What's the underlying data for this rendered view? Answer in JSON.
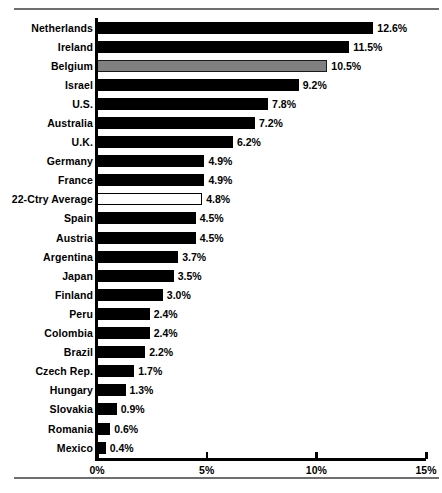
{
  "chart_data": {
    "type": "bar",
    "orientation": "horizontal",
    "title": "",
    "xlabel": "",
    "ylabel": "",
    "xlim": [
      0,
      15
    ],
    "xtick_labels": [
      "0%",
      "5%",
      "10%",
      "15%"
    ],
    "xticks": [
      0,
      5,
      10,
      15
    ],
    "grid": false,
    "legend": null,
    "value_suffix": "%",
    "colors": {
      "bar": "#000000",
      "highlight": "#808080",
      "hollow_fill": "#ffffff",
      "outline": "#000000",
      "rule": "#6e6e6e"
    },
    "categories": [
      "Netherlands",
      "Ireland",
      "Belgium",
      "Israel",
      "U.S.",
      "Australia",
      "U.K.",
      "Germany",
      "France",
      "22-Ctry Average",
      "Spain",
      "Austria",
      "Argentina",
      "Japan",
      "Finland",
      "Peru",
      "Colombia",
      "Brazil",
      "Czech Rep.",
      "Hungary",
      "Slovakia",
      "Romania",
      "Mexico"
    ],
    "values": [
      12.6,
      11.5,
      10.5,
      9.2,
      7.8,
      7.2,
      6.2,
      4.9,
      4.9,
      4.8,
      4.5,
      4.5,
      3.7,
      3.5,
      3.0,
      2.4,
      2.4,
      2.2,
      1.7,
      1.3,
      0.9,
      0.6,
      0.4
    ],
    "value_labels": [
      "12.6%",
      "11.5%",
      "10.5%",
      "9.2%",
      "7.8%",
      "7.2%",
      "6.2%",
      "4.9%",
      "4.9%",
      "4.8%",
      "4.5%",
      "4.5%",
      "3.7%",
      "3.5%",
      "3.0%",
      "2.4%",
      "2.4%",
      "2.2%",
      "1.7%",
      "1.3%",
      "0.9%",
      "0.6%",
      "0.4%"
    ],
    "bar_styles": [
      "solid",
      "solid",
      "highlight",
      "solid",
      "solid",
      "solid",
      "solid",
      "solid",
      "solid",
      "hollow",
      "solid",
      "solid",
      "solid",
      "solid",
      "solid",
      "solid",
      "solid",
      "solid",
      "solid",
      "solid",
      "solid",
      "solid",
      "solid"
    ]
  }
}
